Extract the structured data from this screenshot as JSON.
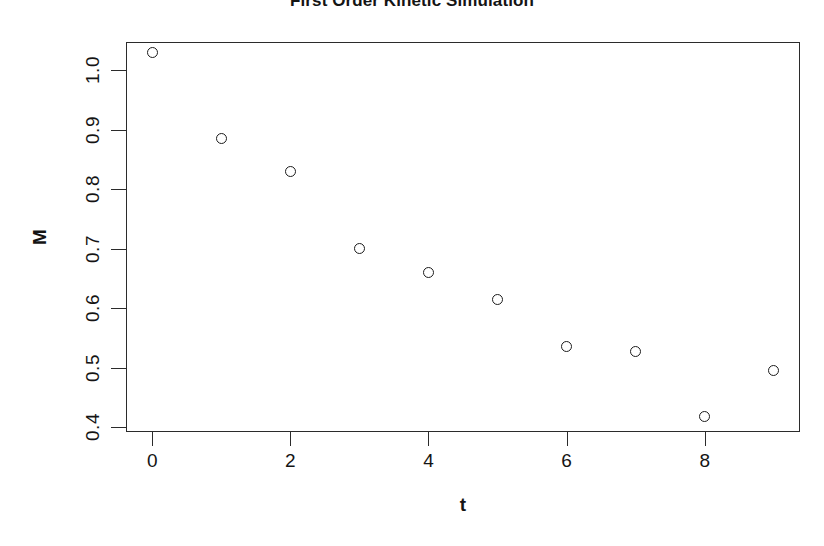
{
  "chart_data": {
    "type": "scatter",
    "title": "First Order Kinetic Simulation",
    "xlabel": "t",
    "ylabel": "M",
    "x": [
      0,
      1,
      2,
      3,
      4,
      5,
      6,
      7,
      8,
      9
    ],
    "values": [
      1.03,
      0.885,
      0.83,
      0.7,
      0.66,
      0.615,
      0.535,
      0.527,
      0.418,
      0.495
    ],
    "xlim": [
      -0.38,
      9.38
    ],
    "ylim": [
      0.392,
      1.047
    ],
    "xticks": [
      0,
      2,
      4,
      6,
      8
    ],
    "xtick_labels": [
      "0",
      "2",
      "4",
      "6",
      "8"
    ],
    "yticks": [
      0.4,
      0.5,
      0.6,
      0.7,
      0.8,
      0.9,
      1.0
    ],
    "ytick_labels": [
      "0.4",
      "0.5",
      "0.6",
      "0.7",
      "0.8",
      "0.9",
      "1.0"
    ],
    "grid": false,
    "legend": null,
    "marker": "open-circle",
    "marker_color": "#1c1c1c",
    "background": "#ffffff"
  }
}
